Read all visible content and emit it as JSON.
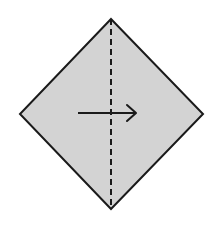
{
  "diagram": {
    "type": "origami-fold-step",
    "canvas": {
      "width": 224,
      "height": 230,
      "background": "#ffffff"
    },
    "paper": {
      "shape": "square-rotated-45",
      "fill": "#d3d3d3",
      "stroke": "#1a1a1a",
      "vertices": {
        "top": [
          111,
          19
        ],
        "right": [
          203,
          114
        ],
        "bottom": [
          111,
          209
        ],
        "left": [
          20,
          114
        ]
      }
    },
    "fold_line": {
      "style": "valley-fold-dashed",
      "from": [
        111,
        19
      ],
      "to": [
        111,
        209
      ],
      "color": "#1a1a1a"
    },
    "arrow": {
      "direction": "right",
      "from": [
        78,
        113
      ],
      "to": [
        137,
        113
      ],
      "color": "#1a1a1a"
    }
  }
}
